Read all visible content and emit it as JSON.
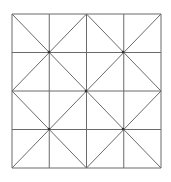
{
  "diagram": {
    "type": "square grid with diagonals",
    "grid": {
      "rows": 4,
      "cols": 4,
      "left": 12,
      "top": 14,
      "right": 161,
      "bottom": 168
    },
    "quadrant_centers": [
      [
        49,
        52
      ],
      [
        123,
        52
      ],
      [
        49,
        129
      ],
      [
        123,
        129
      ]
    ],
    "center_node": [
      86,
      91
    ],
    "line_color": "#6a6a6a"
  }
}
